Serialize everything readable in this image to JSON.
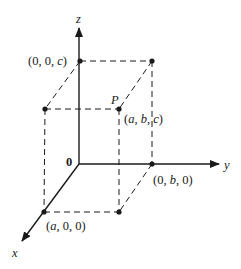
{
  "diagram": {
    "colors": {
      "ink": "#1a1a1a",
      "background": "#ffffff"
    },
    "axes": {
      "x": {
        "label": "x"
      },
      "y": {
        "label": "y"
      },
      "z": {
        "label": "z"
      },
      "origin": {
        "label": "0"
      }
    },
    "points": {
      "z_point": {
        "label": "(0, 0, c)",
        "parts": [
          "(0, 0, ",
          "c",
          ")"
        ]
      },
      "y_point": {
        "label": "(0, b, 0)",
        "parts": [
          "(0, ",
          "b",
          ", 0)"
        ]
      },
      "x_point": {
        "label": "(a, 0, 0)",
        "parts": [
          "(",
          "a",
          ", 0, 0)"
        ]
      },
      "p_point": {
        "name": "P",
        "label": "(a, b, c)",
        "parts": [
          "(",
          "a",
          ", ",
          "b",
          ", ",
          "c",
          ")"
        ]
      }
    }
  }
}
